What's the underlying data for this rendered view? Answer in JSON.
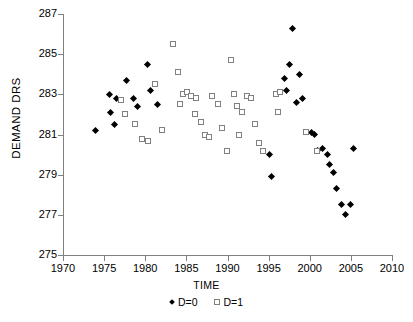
{
  "chart_data": {
    "type": "scatter",
    "title": "",
    "xlabel": "TIME",
    "ylabel": "DEMAND DRS",
    "xlim": [
      1970,
      2010
    ],
    "ylim": [
      275,
      287
    ],
    "xticks": [
      1970,
      1975,
      1980,
      1985,
      1990,
      1995,
      2000,
      2005,
      2010
    ],
    "yticks": [
      275,
      277,
      279,
      281,
      283,
      285,
      287
    ],
    "grid": false,
    "legend_position": "bottom",
    "series": [
      {
        "name": "D=0",
        "marker": "filled-diamond",
        "color": "#000000",
        "points": [
          [
            1974.0,
            281.2
          ],
          [
            1975.6,
            283.0
          ],
          [
            1975.8,
            282.1
          ],
          [
            1976.5,
            282.8
          ],
          [
            1976.3,
            281.5
          ],
          [
            1977.7,
            283.7
          ],
          [
            1978.6,
            282.8
          ],
          [
            1979.0,
            282.4
          ],
          [
            1980.3,
            284.5
          ],
          [
            1980.6,
            283.2
          ],
          [
            1981.5,
            282.5
          ],
          [
            1995.1,
            280.0
          ],
          [
            1995.4,
            278.9
          ],
          [
            1996.9,
            283.8
          ],
          [
            1997.5,
            284.5
          ],
          [
            1997.9,
            286.3
          ],
          [
            1997.2,
            283.2
          ],
          [
            1998.4,
            282.6
          ],
          [
            1998.8,
            284.0
          ],
          [
            1999.1,
            282.8
          ],
          [
            2000.2,
            281.1
          ],
          [
            2000.6,
            281.0
          ],
          [
            2001.0,
            280.2
          ],
          [
            2001.6,
            280.3
          ],
          [
            2002.1,
            280.0
          ],
          [
            2002.4,
            279.5
          ],
          [
            2002.9,
            279.1
          ],
          [
            2003.3,
            278.3
          ],
          [
            2003.9,
            277.5
          ],
          [
            2004.4,
            277.0
          ],
          [
            2004.9,
            277.5
          ],
          [
            2005.3,
            280.3
          ]
        ]
      },
      {
        "name": "D=1",
        "marker": "open-square",
        "color": "#808080",
        "points": [
          [
            1977.1,
            282.7
          ],
          [
            1977.5,
            282.0
          ],
          [
            1978.8,
            281.5
          ],
          [
            1979.6,
            280.8
          ],
          [
            1980.3,
            280.7
          ],
          [
            1981.2,
            283.5
          ],
          [
            1982.0,
            281.2
          ],
          [
            1983.4,
            285.5
          ],
          [
            1984.0,
            284.1
          ],
          [
            1984.6,
            283.0
          ],
          [
            1984.2,
            282.5
          ],
          [
            1985.1,
            283.1
          ],
          [
            1985.6,
            282.9
          ],
          [
            1986.2,
            282.8
          ],
          [
            1986.0,
            282.0
          ],
          [
            1986.8,
            281.6
          ],
          [
            1987.3,
            281.0
          ],
          [
            1987.8,
            280.9
          ],
          [
            1988.1,
            282.9
          ],
          [
            1988.9,
            282.5
          ],
          [
            1989.3,
            281.3
          ],
          [
            1989.9,
            280.2
          ],
          [
            1990.4,
            284.7
          ],
          [
            1990.8,
            283.0
          ],
          [
            1991.2,
            282.4
          ],
          [
            1991.8,
            282.1
          ],
          [
            1991.4,
            281.0
          ],
          [
            1992.4,
            282.9
          ],
          [
            1992.9,
            282.8
          ],
          [
            1993.4,
            281.5
          ],
          [
            1993.8,
            280.6
          ],
          [
            1994.3,
            280.2
          ],
          [
            1995.9,
            283.0
          ],
          [
            1996.4,
            283.1
          ],
          [
            1996.1,
            282.1
          ],
          [
            1999.6,
            281.1
          ],
          [
            2000.9,
            280.2
          ]
        ]
      }
    ]
  }
}
